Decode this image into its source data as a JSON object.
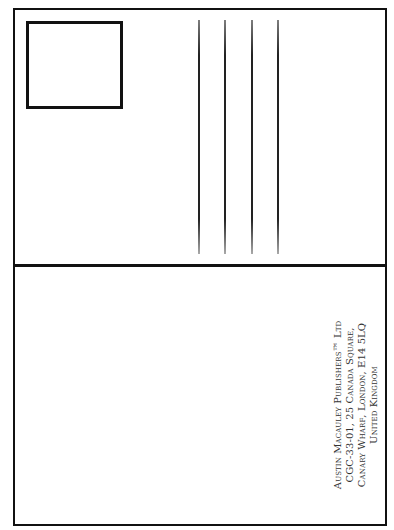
{
  "postcard": {
    "stamp_area": "empty",
    "address_lines_count": 4,
    "recipient": {
      "lines": [
        "Austin Macauley Publishers™ Ltd",
        "CGC-33-01, 25 Canada Square,",
        "Canary Wharf, London, E14 5LQ",
        "United Kingdom"
      ]
    },
    "colors": {
      "border": "#111111",
      "text": "#333333",
      "background": "#ffffff"
    }
  }
}
